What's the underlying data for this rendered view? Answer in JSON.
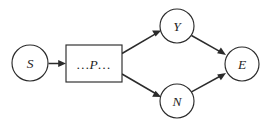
{
  "diagram": {
    "type": "flow-graph",
    "title": "",
    "background_color": "#ffffff",
    "stroke_color": "#2b2b2b",
    "label_color": "#1f1f1f",
    "nodes": [
      {
        "id": "S",
        "label": "S",
        "shape": "circle",
        "cx": 30,
        "cy": 63,
        "r": 18
      },
      {
        "id": "P",
        "label": "…P…",
        "shape": "rectangle",
        "x": 66,
        "y": 45,
        "width": 56,
        "height": 37
      },
      {
        "id": "Y",
        "label": "Y",
        "shape": "circle",
        "cx": 177,
        "cy": 26,
        "r": 17
      },
      {
        "id": "N",
        "label": "N",
        "shape": "circle",
        "cx": 177,
        "cy": 101,
        "r": 17
      },
      {
        "id": "E",
        "label": "E",
        "shape": "circle",
        "cx": 242,
        "cy": 64,
        "r": 17
      }
    ],
    "edges": [
      {
        "id": "S-P",
        "from": "S",
        "to": "P",
        "label": "",
        "arrow": "to"
      },
      {
        "id": "P-Y",
        "from": "P",
        "to": "Y",
        "label": "",
        "arrow": "to"
      },
      {
        "id": "P-N",
        "from": "P",
        "to": "N",
        "label": "",
        "arrow": "to"
      },
      {
        "id": "Y-E",
        "from": "Y",
        "to": "E",
        "label": "",
        "arrow": "to"
      },
      {
        "id": "N-E",
        "from": "N",
        "to": "E",
        "label": "",
        "arrow": "to"
      }
    ]
  }
}
